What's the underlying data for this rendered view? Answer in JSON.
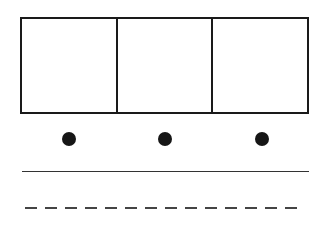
{
  "diagram": {
    "boxes": {
      "count": 3,
      "cells": [
        {
          "label": ""
        },
        {
          "label": ""
        },
        {
          "label": ""
        }
      ],
      "stroke_color": "#1a1a1a"
    },
    "dots": [
      {
        "cx": 69,
        "cy": 139
      },
      {
        "cx": 165,
        "cy": 139
      },
      {
        "cx": 262,
        "cy": 139
      }
    ],
    "dot_color": "#161616",
    "lines": [
      {
        "style": "solid",
        "y": 172,
        "color": "#333333"
      },
      {
        "style": "dashed",
        "y": 208,
        "color": "#444444"
      }
    ]
  }
}
